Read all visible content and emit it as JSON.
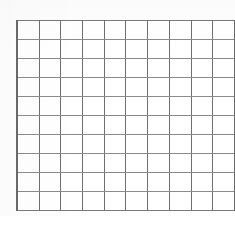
{
  "figure": {
    "kind": "blank-grid",
    "title": "",
    "caption": "",
    "background_color": "#fefefe",
    "cell_fill_color": "#ffffff",
    "line_color_horizontal": "#8b8b8b",
    "line_color_vertical": "#6e6e6e",
    "border_color": "#6a6a6a"
  },
  "grid": {
    "rows": 10,
    "columns": 10,
    "total_cells": 100,
    "cell_width_px": 20.7,
    "cell_height_px": 18,
    "grid_left_px": 16,
    "grid_top_px": 20,
    "grid_width_px": 207,
    "grid_height_px": 180,
    "cells_empty": true,
    "cell_labels": [
      [
        "",
        "",
        "",
        "",
        "",
        "",
        "",
        "",
        "",
        ""
      ],
      [
        "",
        "",
        "",
        "",
        "",
        "",
        "",
        "",
        "",
        ""
      ],
      [
        "",
        "",
        "",
        "",
        "",
        "",
        "",
        "",
        "",
        ""
      ],
      [
        "",
        "",
        "",
        "",
        "",
        "",
        "",
        "",
        "",
        ""
      ],
      [
        "",
        "",
        "",
        "",
        "",
        "",
        "",
        "",
        "",
        ""
      ],
      [
        "",
        "",
        "",
        "",
        "",
        "",
        "",
        "",
        "",
        ""
      ],
      [
        "",
        "",
        "",
        "",
        "",
        "",
        "",
        "",
        "",
        ""
      ],
      [
        "",
        "",
        "",
        "",
        "",
        "",
        "",
        "",
        "",
        ""
      ],
      [
        "",
        "",
        "",
        "",
        "",
        "",
        "",
        "",
        "",
        ""
      ],
      [
        "",
        "",
        "",
        "",
        "",
        "",
        "",
        "",
        "",
        ""
      ]
    ]
  }
}
